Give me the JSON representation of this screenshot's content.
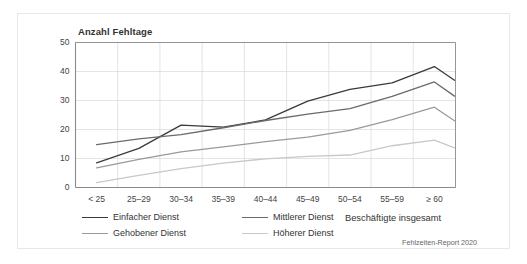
{
  "figure": {
    "axis_title": "Anzahl Fehltage",
    "total_label": "Beschäftigte insgesamt",
    "source_note": "Fehlzeiten-Report 2020",
    "frame_color": "#e8e8e8",
    "background": "#ffffff",
    "grid_color": "#d9d9d9",
    "axis_color": "#8a8a8a",
    "text_color": "#333333"
  },
  "legend": {
    "entries": [
      {
        "label": "Einfacher Dienst",
        "color": "#3a3a3a",
        "row": 0,
        "col": 0
      },
      {
        "label": "Mittlerer Dienst",
        "color": "#6a6a6a",
        "row": 0,
        "col": 1
      },
      {
        "label": "Gehobener Dienst",
        "color": "#9a9a9a",
        "row": 1,
        "col": 0
      },
      {
        "label": "Höherer Dienst",
        "color": "#c8c8c8",
        "row": 1,
        "col": 1
      }
    ]
  },
  "chart_data": {
    "type": "line",
    "title": "",
    "xlabel": "",
    "ylabel": "Anzahl Fehltage",
    "categories": [
      "< 25",
      "25–29",
      "30–34",
      "35–39",
      "40–44",
      "45–49",
      "50–54",
      "55–59",
      "≥ 60"
    ],
    "extra_point_label": "Beschäftigte insgesamt",
    "ylim": [
      0,
      50
    ],
    "yticks": [
      0,
      10,
      20,
      30,
      40,
      50
    ],
    "grid": true,
    "legend_position": "bottom-left",
    "series": [
      {
        "name": "Einfacher Dienst",
        "color": "#3a3a3a",
        "values": [
          8.5,
          13.5,
          21.5,
          20.8,
          23.3,
          29.8,
          33.8,
          36.1,
          41.7
        ],
        "total": 37.0
      },
      {
        "name": "Mittlerer Dienst",
        "color": "#6a6a6a",
        "values": [
          14.8,
          16.8,
          18.2,
          20.6,
          23.1,
          25.3,
          27.2,
          31.4,
          36.4
        ],
        "total": 31.5
      },
      {
        "name": "Gehobener Dienst",
        "color": "#9a9a9a",
        "values": [
          6.8,
          9.7,
          12.3,
          14.0,
          15.8,
          17.4,
          19.7,
          23.4,
          27.7
        ],
        "total": 23.0
      },
      {
        "name": "Höherer Dienst",
        "color": "#c8c8c8",
        "values": [
          1.7,
          4.2,
          6.5,
          8.4,
          9.9,
          10.7,
          11.2,
          14.4,
          16.3
        ],
        "total": 13.7
      }
    ]
  }
}
